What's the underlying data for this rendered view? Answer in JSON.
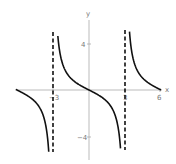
{
  "chart_data": {
    "type": "line",
    "title": "",
    "function": "y = -tan(pi*x/6)",
    "xlabel": "x",
    "ylabel": "y",
    "xlim": [
      -6,
      6
    ],
    "ylim": [
      -5,
      5
    ],
    "x_ticks": [
      -3,
      3,
      6
    ],
    "x_tick_labels": [
      "-3",
      "3",
      "6"
    ],
    "y_ticks": [
      4,
      -4
    ],
    "y_tick_labels": [
      "4",
      "−4"
    ],
    "asymptotes": [
      -3,
      3
    ],
    "grid": false,
    "legend": null,
    "series": [
      {
        "name": "branch-left",
        "x": [
          -6,
          -5,
          -4,
          -3.5,
          -3.2
        ],
        "y": [
          0,
          -0.58,
          -1.73,
          -3.73,
          -9.5
        ]
      },
      {
        "name": "branch-center",
        "x": [
          -2.8,
          -2.5,
          -2,
          -1,
          0,
          1,
          2,
          2.5,
          2.8
        ],
        "y": [
          9.5,
          3.73,
          1.73,
          0.58,
          0,
          -0.58,
          -1.73,
          -3.73,
          -9.5
        ]
      },
      {
        "name": "branch-right",
        "x": [
          3.2,
          3.5,
          4,
          5,
          6
        ],
        "y": [
          9.5,
          3.73,
          1.73,
          0.58,
          0
        ]
      }
    ]
  },
  "labels": {
    "x_axis": "x",
    "y_axis": "y",
    "tick_neg3": "−3",
    "tick_3": "3",
    "tick_6": "6",
    "tick_4": "4",
    "tick_neg4": "−4"
  }
}
